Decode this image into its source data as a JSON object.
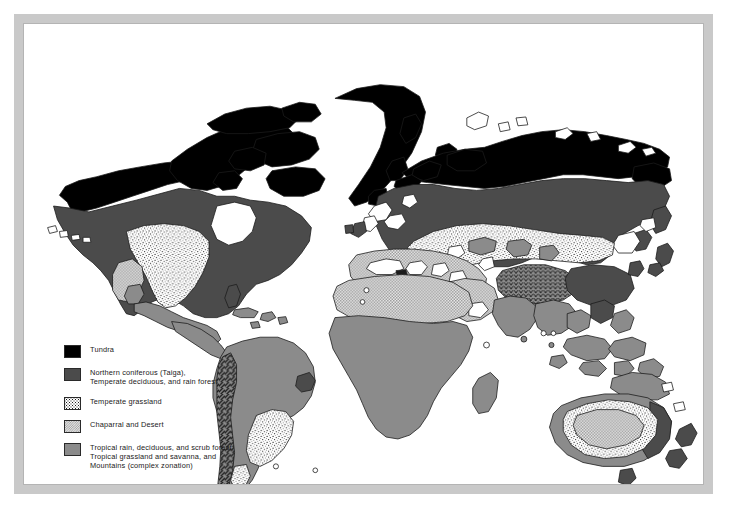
{
  "figure": {
    "kind": "world-biomes-thematic-map",
    "frame_color": "#c9c9c9",
    "background": "#ffffff",
    "projection_note": "world map, all continents except Antarctica"
  },
  "legend": {
    "title": "",
    "items": [
      {
        "key": "tundra",
        "label": "Tundra",
        "swatch": "solid-black",
        "color": "#000000"
      },
      {
        "key": "northern-coniferous",
        "label": "Northern coniferous (Taiga),\nTemperate deciduous, and rain forest",
        "swatch": "solid-dark-gray",
        "color": "#4b4b4b"
      },
      {
        "key": "temperate-grassland",
        "label": "Temperate grassland",
        "swatch": "white-stipple",
        "color": "#ffffff"
      },
      {
        "key": "chaparral-desert",
        "label": "Chaparral and Desert",
        "swatch": "light-checker",
        "color": "#e3e3e3"
      },
      {
        "key": "tropical",
        "label": "Tropical rain, deciduous, and scrub forest,\nTropical grassland and savanna, and\nMountains (complex zonation)",
        "swatch": "solid-medium-gray",
        "color": "#8b8b8b"
      }
    ]
  },
  "map_regions": [
    {
      "name": "north-america",
      "biomes": [
        "tundra",
        "northern-coniferous",
        "temperate-grassland",
        "chaparral-desert",
        "tropical"
      ]
    },
    {
      "name": "greenland",
      "biomes": [
        "tundra"
      ]
    },
    {
      "name": "south-america",
      "biomes": [
        "tropical",
        "temperate-grassland",
        "northern-coniferous"
      ]
    },
    {
      "name": "europe",
      "biomes": [
        "tundra",
        "northern-coniferous",
        "chaparral-desert"
      ]
    },
    {
      "name": "africa",
      "biomes": [
        "chaparral-desert",
        "tropical"
      ]
    },
    {
      "name": "asia",
      "biomes": [
        "tundra",
        "northern-coniferous",
        "temperate-grassland",
        "chaparral-desert",
        "tropical"
      ]
    },
    {
      "name": "australia",
      "biomes": [
        "chaparral-desert",
        "temperate-grassland",
        "northern-coniferous",
        "tropical"
      ]
    },
    {
      "name": "new-zealand",
      "biomes": [
        "northern-coniferous"
      ]
    },
    {
      "name": "southeast-asia-islands",
      "biomes": [
        "tropical"
      ]
    }
  ],
  "palette": {
    "tundra": "#000000",
    "coniferous": "#4b4b4b",
    "tropical": "#8b8b8b",
    "desert_base": "#e3e3e3",
    "grassland_base": "#ffffff",
    "coast_line": "#1a1a1a",
    "frame": "#c9c9c9"
  }
}
